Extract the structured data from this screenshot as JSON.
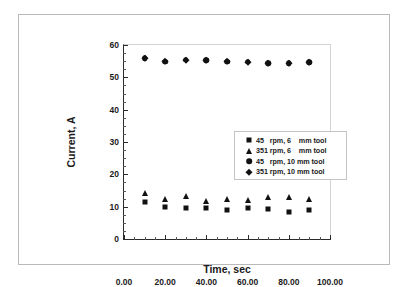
{
  "chart_data": {
    "type": "scatter",
    "title": "",
    "xlabel": "Time, sec",
    "ylabel": "Current, A",
    "xlim": [
      0,
      100
    ],
    "ylim": [
      0,
      60
    ],
    "xticks": [
      0,
      20,
      40,
      60,
      80,
      100
    ],
    "xtick_labels": [
      "0.00",
      "20.00",
      "40.00",
      "60.00",
      "80.00",
      "100.00"
    ],
    "yticks": [
      0,
      10,
      20,
      30,
      40,
      50,
      60
    ],
    "ytick_labels": [
      "0",
      "10",
      "20",
      "30",
      "40",
      "50",
      "60"
    ],
    "x_minor_step": 5,
    "y_minor_step": 2.5,
    "grid": false,
    "legend_position": "center-left-upper",
    "x": [
      10,
      20,
      30,
      40,
      50,
      60,
      70,
      80,
      90
    ],
    "series": [
      {
        "name": "45   rpm, 6    mm tool",
        "marker": "square",
        "color": "#111111",
        "values": [
          11.3,
          10.0,
          9.5,
          9.5,
          9.0,
          9.5,
          9.3,
          8.5,
          9.0
        ]
      },
      {
        "name": "351 rpm, 6    mm tool",
        "marker": "triangle",
        "color": "#111111",
        "values": [
          14.2,
          12.5,
          13.2,
          11.8,
          12.4,
          12.2,
          13.1,
          13.0,
          12.3
        ]
      },
      {
        "name": "45   rpm, 10 mm tool",
        "marker": "circle",
        "color": "#111111",
        "values": [
          55.9,
          54.8,
          55.4,
          55.3,
          54.8,
          54.8,
          54.4,
          54.4,
          54.6
        ]
      },
      {
        "name": "351 rpm, 10 mm tool",
        "marker": "diamond",
        "color": "#111111",
        "values": [
          56.0,
          54.9,
          55.4,
          55.3,
          54.9,
          54.8,
          54.3,
          54.5,
          54.6
        ]
      }
    ]
  },
  "legend": {
    "entries": [
      {
        "marker": "square",
        "label": "45   rpm, 6    mm tool"
      },
      {
        "marker": "triangle",
        "label": "351 rpm, 6    mm tool"
      },
      {
        "marker": "circle",
        "label": "45   rpm, 10 mm tool"
      },
      {
        "marker": "diamond",
        "label": "351 rpm, 10 mm tool"
      }
    ]
  },
  "colors": {
    "marker": "#111111",
    "axis": "#2b2b2b",
    "frame": "#b9b9b9",
    "background": "#ffffff"
  }
}
